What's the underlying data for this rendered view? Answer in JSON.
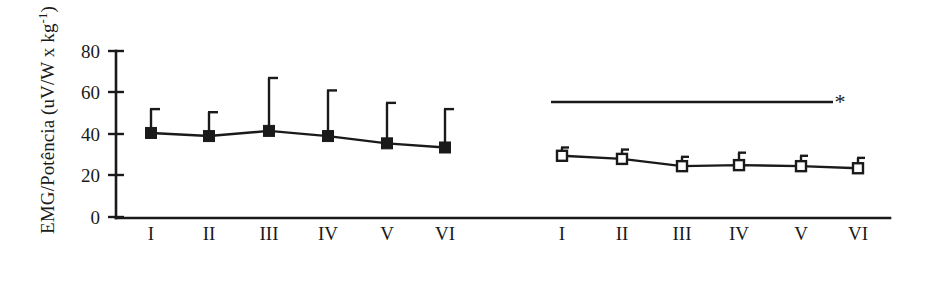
{
  "chart_data": {
    "type": "line",
    "title": "",
    "xlabel": "",
    "ylabel_prefix": "EMG/Potência (uV/W x kg",
    "ylabel_superscript": "-1",
    "ylabel_suffix": ")",
    "ylabel_full": "EMG/Potência (uV/W x kg-1)",
    "ylim": [
      0,
      80
    ],
    "yticks": [
      0,
      20,
      40,
      60,
      80
    ],
    "ytick_labels": [
      "0",
      "20",
      "40",
      "60",
      "80"
    ],
    "grid": false,
    "legend": "none",
    "groups": [
      {
        "name": "group-left",
        "marker": "filled-square",
        "categories": [
          "I",
          "II",
          "III",
          "IV",
          "V",
          "VI"
        ],
        "values": [
          40.5,
          39.0,
          41.5,
          39.0,
          35.5,
          33.5
        ],
        "error_upper": [
          52.0,
          50.5,
          67.0,
          61.0,
          55.0,
          52.0
        ]
      },
      {
        "name": "group-right",
        "marker": "open-square",
        "categories": [
          "I",
          "II",
          "III",
          "IV",
          "V",
          "VI"
        ],
        "values": [
          29.5,
          28.0,
          24.5,
          25.0,
          24.5,
          23.5
        ],
        "error_upper": [
          33.5,
          32.5,
          29.0,
          31.0,
          29.5,
          28.5
        ]
      }
    ],
    "annotations": [
      {
        "name": "significance-bar",
        "type": "horizontal-bar-with-star",
        "y_value": 55,
        "symbol": "*",
        "applies_to": "group-right"
      }
    ]
  }
}
